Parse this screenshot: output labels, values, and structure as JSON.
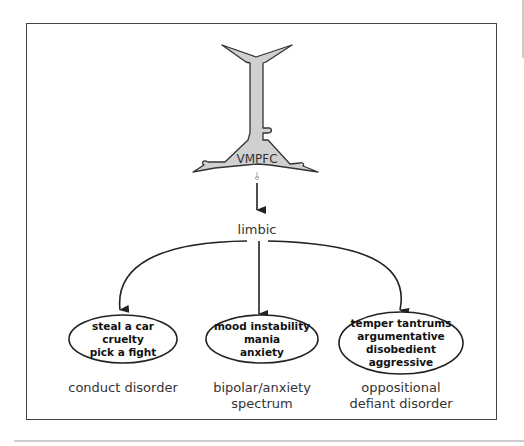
{
  "diagram": {
    "top_node": {
      "label": "VMPFC",
      "icon": "neuron-icon"
    },
    "middle_node": {
      "label": "limbic"
    },
    "branches": [
      {
        "symptoms": [
          "steal a car",
          "cruelty",
          "pick a fight"
        ],
        "disorder": "conduct disorder"
      },
      {
        "symptoms": [
          "mood instability",
          "mania",
          "anxiety"
        ],
        "disorder": "bipolar/anxiety spectrum"
      },
      {
        "symptoms": [
          "temper tantrums",
          "argumentative",
          "disobedient",
          "aggressive"
        ],
        "disorder": "oppositional defiant disorder"
      }
    ],
    "colors": {
      "neuron_fill": "#d0d0d0",
      "stroke": "#333333",
      "frame": "#444444",
      "connector": "#aaaaaa"
    }
  }
}
